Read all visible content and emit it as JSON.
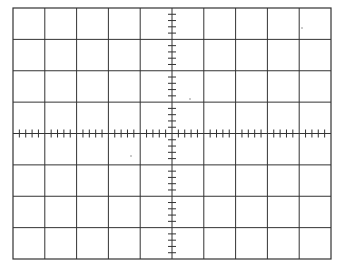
{
  "graticule": {
    "title": "Oscilloscope graticule",
    "left": 13,
    "top": 8,
    "right": 331,
    "bottom": 259,
    "h_divisions": 10,
    "v_divisions": 8,
    "minor_ticks_per_division": 5,
    "line_color": "#333333",
    "background": "#ffffff",
    "dots": [
      {
        "x": 302,
        "y": 28
      },
      {
        "x": 190,
        "y": 99
      },
      {
        "x": 131,
        "y": 156
      }
    ]
  }
}
